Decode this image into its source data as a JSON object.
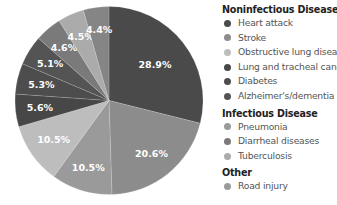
{
  "chart_data": {
    "type": "pie",
    "title": "",
    "start_angle": "12 o'clock, clockwise",
    "slices": [
      {
        "label": "Heart attack",
        "group": "Noninfectious Disease",
        "value": 28.9,
        "display": "28.9%",
        "color": "#4a4a4a"
      },
      {
        "label": "Stroke",
        "group": "Noninfectious Disease",
        "value": 20.6,
        "display": "20.6%",
        "color": "#8c8c8c"
      },
      {
        "label": "Pneumonia",
        "group": "Infectious Disease",
        "value": 10.5,
        "display": "10.5%",
        "color": "#9a9a9a"
      },
      {
        "label": "Obstructive lung disease",
        "group": "Noninfectious Disease",
        "value": 10.5,
        "display": "10.5%",
        "color": "#bdbdbd"
      },
      {
        "label": "Lung and tracheal cancers",
        "group": "Noninfectious Disease",
        "value": 5.6,
        "display": "5.6%",
        "color": "#474747"
      },
      {
        "label": "Diabetes",
        "group": "Noninfectious Disease",
        "value": 5.3,
        "display": "5.3%",
        "color": "#4d4d4d"
      },
      {
        "label": "Alzheimer's/dementia",
        "group": "Noninfectious Disease",
        "value": 5.1,
        "display": "5.1%",
        "color": "#545454"
      },
      {
        "label": "Diarrheal diseases",
        "group": "Infectious Disease",
        "value": 4.6,
        "display": "4.6%",
        "color": "#7a7a7a"
      },
      {
        "label": "Tuberculosis",
        "group": "Infectious Disease",
        "value": 4.5,
        "display": "4.5%",
        "color": "#ababab"
      },
      {
        "label": "Road injury",
        "group": "Other",
        "value": 4.4,
        "display": "4.4%",
        "color": "#858585"
      }
    ],
    "legend_position": "right"
  },
  "legend": {
    "groups": [
      {
        "title": "Noninfectious Disease",
        "items": [
          {
            "label": "Heart attack",
            "color": "#4a4a4a"
          },
          {
            "label": "Stroke",
            "color": "#8c8c8c"
          },
          {
            "label": "Obstructive lung disease",
            "color": "#bdbdbd"
          },
          {
            "label": "Lung and tracheal cancers",
            "color": "#474747"
          },
          {
            "label": "Diabetes",
            "color": "#4d4d4d"
          },
          {
            "label": "Alzheimer's/dementia",
            "color": "#545454"
          }
        ]
      },
      {
        "title": "Infectious Disease",
        "items": [
          {
            "label": "Pneumonia",
            "color": "#9a9a9a"
          },
          {
            "label": "Diarrheal diseases",
            "color": "#7a7a7a"
          },
          {
            "label": "Tuberculosis",
            "color": "#ababab"
          }
        ]
      },
      {
        "title": "Other",
        "items": [
          {
            "label": "Road injury",
            "color": "#9a9a9a"
          }
        ]
      }
    ]
  }
}
